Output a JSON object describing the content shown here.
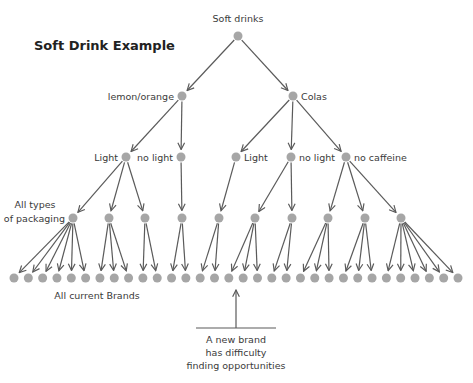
{
  "title": "Soft Drink Example",
  "root": {
    "label": "Soft drinks"
  },
  "level1": [
    {
      "label": "lemon/orange"
    },
    {
      "label": "Colas"
    }
  ],
  "level2": [
    {
      "label": "Light",
      "parent": 0
    },
    {
      "label": "no light",
      "parent": 0
    },
    {
      "label": "Light",
      "parent": 1
    },
    {
      "label": "no light",
      "parent": 1
    },
    {
      "label": "no caffeine",
      "parent": 1
    }
  ],
  "level3": [
    {
      "label": "All types\nof packaging",
      "parent": 0,
      "leaves": 6
    },
    {
      "label": "",
      "parent": 0,
      "leaves": 3
    },
    {
      "label": "",
      "parent": 0,
      "leaves": 2
    },
    {
      "label": "",
      "parent": 1,
      "leaves": 2
    },
    {
      "label": "",
      "parent": 2,
      "leaves": 2
    },
    {
      "label": "",
      "parent": 3,
      "leaves": 3
    },
    {
      "label": "",
      "parent": 3,
      "leaves": 2
    },
    {
      "label": "",
      "parent": 4,
      "leaves": 3
    },
    {
      "label": "",
      "parent": 4,
      "leaves": 3
    },
    {
      "label": "",
      "parent": 4,
      "leaves": 6
    }
  ],
  "leaves_label": "All current Brands",
  "leaf_count": 32,
  "annotation": {
    "lines": [
      "A new brand",
      "has difficulty",
      "finding opportunities"
    ]
  },
  "colors": {
    "node": "#a6a6a6",
    "edge": "#5a5a5a",
    "text": "#3a3a3a"
  }
}
